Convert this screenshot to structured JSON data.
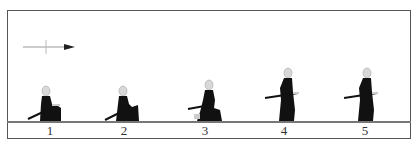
{
  "diagram": {
    "direction_arrow": {
      "icon": "right-arrow-icon",
      "direction": "right"
    },
    "figures": [
      {
        "step": "1",
        "pose": "seated-kneeling",
        "x": 50
      },
      {
        "step": "2",
        "pose": "seated-kneeling-lean",
        "x": 124
      },
      {
        "step": "3",
        "pose": "rising-kneel",
        "x": 208
      },
      {
        "step": "4",
        "pose": "standing",
        "x": 287
      },
      {
        "step": "5",
        "pose": "standing",
        "x": 367
      }
    ],
    "colors": {
      "figure": "#111111",
      "head": "#d8d8d8",
      "frame": "#555555",
      "ground": "#777777"
    }
  }
}
